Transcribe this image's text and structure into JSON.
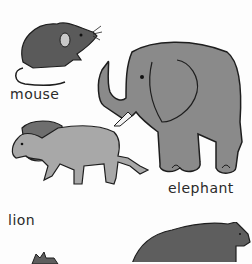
{
  "page": {
    "labels": {
      "mouse": "mouse",
      "elephant": "elephant",
      "lion": "lion"
    },
    "colors": {
      "mouse_fill": "#5a5a5a",
      "elephant_fill": "#8a8a8a",
      "lion_body": "#a8a8a8",
      "lion_mane": "#6e6e6e",
      "bear_fill": "#5e5e5e",
      "outline": "#1e1e1e",
      "background": "#fdfdfd"
    }
  }
}
